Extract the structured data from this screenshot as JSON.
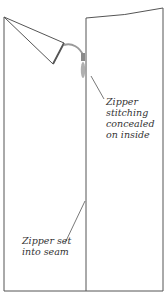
{
  "diagram": {
    "title": "",
    "colors": {
      "line": "#555555",
      "zipper": "#9a9a9a",
      "text": "#333333",
      "background": "#ffffff"
    },
    "labels": {
      "stitching": {
        "lines": [
          "Zipper",
          "stitching",
          "concealed",
          "on inside"
        ]
      },
      "seam": {
        "lines": [
          "Zipper set",
          "into seam"
        ]
      }
    }
  }
}
